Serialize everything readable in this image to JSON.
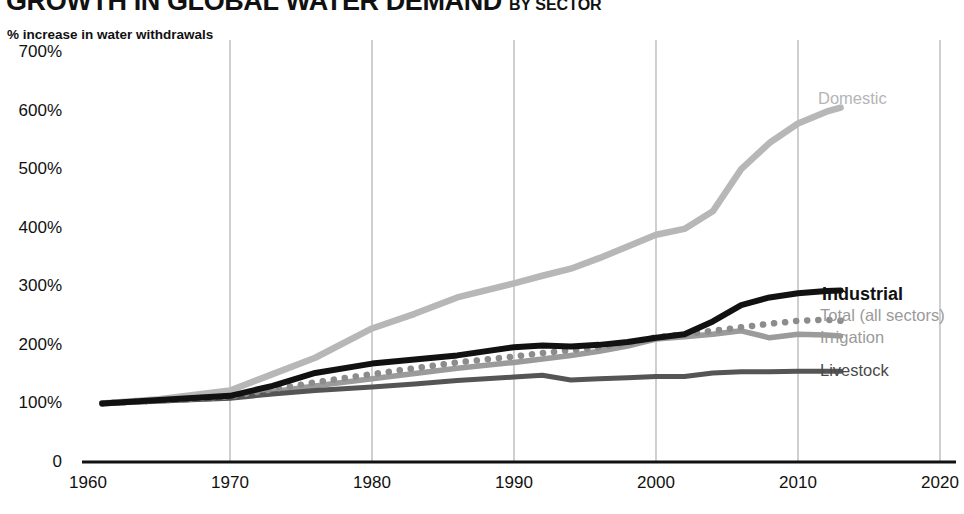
{
  "header": {
    "title": "GROWTH IN GLOBAL WATER DEMAND",
    "subtitle": "BY SECTOR",
    "axis_note": "% increase in water withdrawals"
  },
  "colors": {
    "domestic": "#b7b7b7",
    "industrial": "#111111",
    "total": "#8c8c8c",
    "irrigation": "#9b9b9b",
    "livestock": "#555555",
    "gridline": "#b0b0b0",
    "axis": "#111111"
  },
  "labels": {
    "domestic": "Domestic",
    "industrial": "Industrial",
    "total": "Total (all sectors)",
    "irrigation": "Irrigation",
    "livestock": "Livestock"
  },
  "chart_data": {
    "type": "line",
    "xlabel": "",
    "ylabel": "% increase in water withdrawals",
    "xlim": [
      1960,
      2020
    ],
    "ylim": [
      0,
      700
    ],
    "grid": "vertical",
    "legend": "inline-right",
    "yticks": [
      "0",
      "100%",
      "200%",
      "300%",
      "400%",
      "500%",
      "600%",
      "700%"
    ],
    "ytick_values": [
      0,
      100,
      200,
      300,
      400,
      500,
      600,
      700
    ],
    "xticks": [
      "1960",
      "1970",
      "1980",
      "1990",
      "2000",
      "2010",
      "2020"
    ],
    "xtick_values": [
      1960,
      1970,
      1980,
      1990,
      2000,
      2010,
      2020
    ],
    "x": [
      1961,
      1965,
      1970,
      1973,
      1976,
      1980,
      1983,
      1986,
      1990,
      1992,
      1994,
      1996,
      1998,
      2000,
      2002,
      2004,
      2006,
      2008,
      2010,
      2012,
      2013
    ],
    "series": [
      {
        "name": "Domestic",
        "style": "solid",
        "color": "#b7b7b7",
        "values": [
          100,
          107,
          122,
          150,
          178,
          228,
          253,
          281,
          305,
          318,
          330,
          348,
          368,
          388,
          398,
          428,
          500,
          545,
          578,
          598,
          605
        ]
      },
      {
        "name": "Industrial",
        "style": "solid-bold",
        "color": "#111111",
        "values": [
          100,
          106,
          113,
          130,
          152,
          168,
          175,
          182,
          196,
          199,
          197,
          200,
          205,
          212,
          218,
          240,
          268,
          281,
          288,
          292,
          293
        ]
      },
      {
        "name": "Total (all sectors)",
        "style": "dotted",
        "color": "#8c8c8c",
        "values": [
          100,
          105,
          112,
          124,
          136,
          150,
          160,
          170,
          180,
          186,
          191,
          196,
          203,
          213,
          218,
          224,
          230,
          236,
          241,
          243,
          241
        ]
      },
      {
        "name": "Irrigation",
        "style": "solid",
        "color": "#9b9b9b",
        "values": [
          100,
          104,
          110,
          120,
          130,
          142,
          151,
          160,
          170,
          176,
          182,
          189,
          198,
          210,
          214,
          218,
          224,
          212,
          218,
          217,
          215
        ]
      },
      {
        "name": "Livestock",
        "style": "solid",
        "color": "#555555",
        "values": [
          100,
          104,
          109,
          116,
          122,
          128,
          133,
          139,
          145,
          148,
          140,
          142,
          144,
          146,
          146,
          152,
          154,
          154,
          155,
          155,
          155
        ]
      }
    ]
  }
}
